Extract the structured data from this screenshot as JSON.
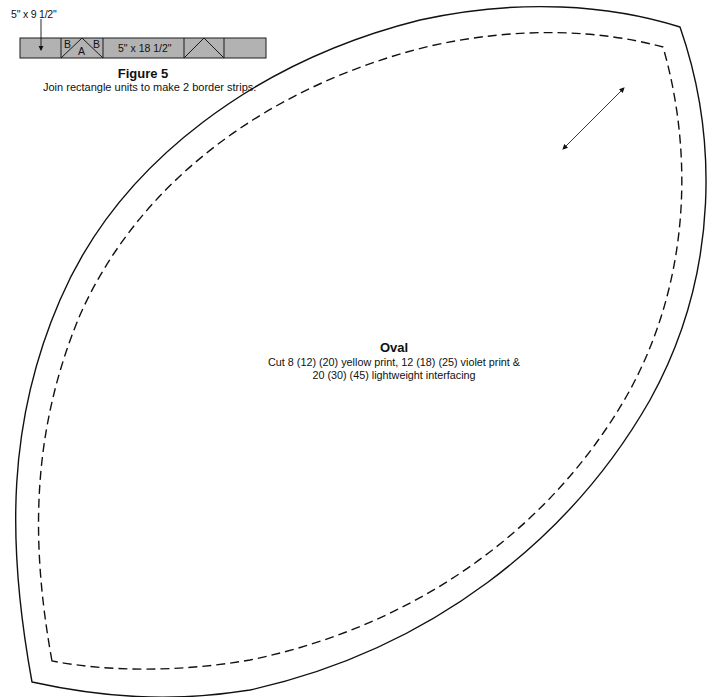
{
  "figure": {
    "dimension_label_top": "5\" x 9 1/2\"",
    "strip": {
      "fill_color": "#b2b2b2",
      "stroke_color": "#1a1a1a",
      "segments": [
        {
          "type": "rectangle",
          "label": ""
        },
        {
          "type": "triangle-unit",
          "labels": {
            "left": "B",
            "center": "A",
            "right": "B"
          }
        },
        {
          "type": "rectangle",
          "label": "5\" x 18 1/2\""
        },
        {
          "type": "triangle-unit",
          "labels": {}
        },
        {
          "type": "rectangle",
          "label": ""
        }
      ]
    },
    "title": "Figure 5",
    "caption": "Join rectangle units to make 2 border strips."
  },
  "pattern": {
    "name": "Oval",
    "instructions_line1": "Cut 8 (12) (20) yellow print, 12 (18) (25) violet print &",
    "instructions_line2": "20 (30) (45) lightweight interfacing",
    "cut_line": "solid",
    "seam_line": "dashed",
    "grain_arrow": "double-headed-diagonal"
  }
}
